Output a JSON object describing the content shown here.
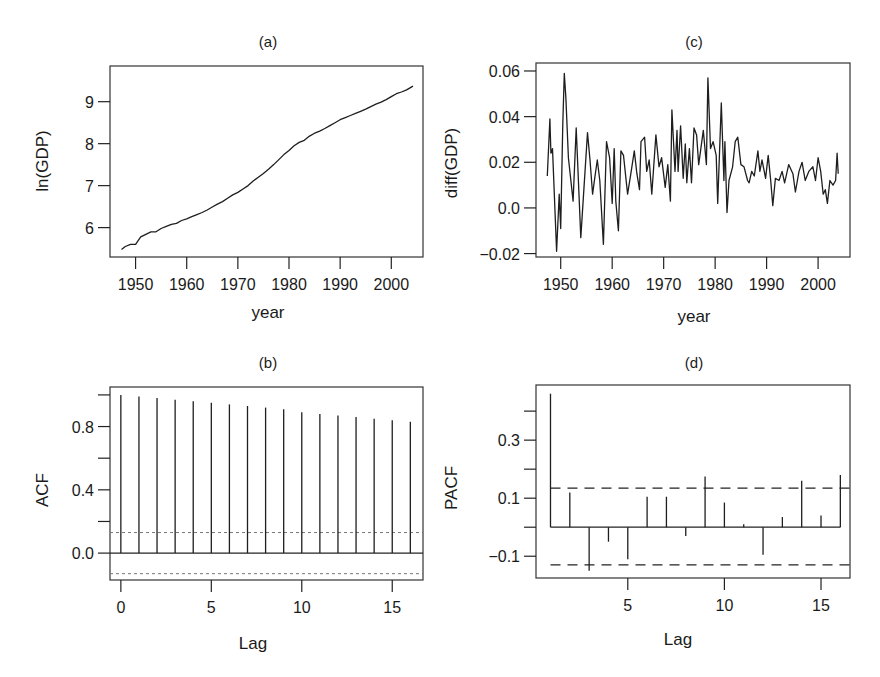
{
  "chart_data": [
    {
      "panel": "(a)",
      "type": "line",
      "title": "(a)",
      "xlabel": "year",
      "ylabel": "ln(GDP)",
      "xticks": [
        1950,
        1960,
        1970,
        1980,
        1990,
        2000
      ],
      "yticks": [
        6,
        7,
        8,
        9
      ],
      "xlim": [
        1945.0,
        2006.2
      ],
      "ylim": [
        5.3,
        9.85
      ],
      "grid": false,
      "x": [
        1947.25,
        1948,
        1949,
        1950,
        1951,
        1952,
        1953,
        1954,
        1955,
        1956,
        1957,
        1958,
        1959,
        1960,
        1961,
        1962,
        1963,
        1964,
        1965,
        1966,
        1967,
        1968,
        1969,
        1970,
        1971,
        1972,
        1973,
        1974,
        1975,
        1976,
        1977,
        1978,
        1979,
        1980,
        1981,
        1982,
        1983,
        1984,
        1985,
        1986,
        1987,
        1988,
        1989,
        1990,
        1991,
        1992,
        1993,
        1994,
        1995,
        1996,
        1997,
        1998,
        1999,
        2000,
        2001,
        2002,
        2003,
        2004.25
      ],
      "values": [
        5.48,
        5.55,
        5.6,
        5.6,
        5.78,
        5.84,
        5.9,
        5.9,
        5.98,
        6.03,
        6.08,
        6.1,
        6.17,
        6.21,
        6.26,
        6.31,
        6.36,
        6.42,
        6.49,
        6.56,
        6.62,
        6.7,
        6.78,
        6.84,
        6.92,
        7.0,
        7.11,
        7.2,
        7.29,
        7.39,
        7.5,
        7.62,
        7.74,
        7.84,
        7.95,
        8.03,
        8.08,
        8.18,
        8.25,
        8.3,
        8.36,
        8.43,
        8.5,
        8.57,
        8.62,
        8.67,
        8.72,
        8.77,
        8.82,
        8.88,
        8.94,
        8.99,
        9.05,
        9.12,
        9.19,
        9.23,
        9.28,
        9.37
      ]
    },
    {
      "panel": "(b)",
      "type": "bar",
      "subtype": "acf-stem",
      "title": "(b)",
      "xlabel": "Lag",
      "ylabel": "ACF",
      "xticks": [
        0,
        5,
        10,
        15
      ],
      "yticks_labeled": [
        0.0,
        0.4,
        0.8
      ],
      "yticks": [
        0.0,
        0.2,
        0.4,
        0.6,
        0.8,
        1.0
      ],
      "xlim": [
        -0.6,
        16.7
      ],
      "ylim": [
        -0.17,
        1.05
      ],
      "categories": [
        0,
        1,
        2,
        3,
        4,
        5,
        6,
        7,
        8,
        9,
        10,
        11,
        12,
        13,
        14,
        15,
        16
      ],
      "values": [
        1.0,
        0.99,
        0.98,
        0.97,
        0.96,
        0.95,
        0.94,
        0.93,
        0.92,
        0.91,
        0.89,
        0.88,
        0.87,
        0.86,
        0.85,
        0.84,
        0.83
      ],
      "confidence_band": [
        -0.13,
        0.13
      ],
      "band_style": "dotted",
      "grid": false
    },
    {
      "panel": "(c)",
      "type": "line",
      "title": "(c)",
      "xlabel": "year",
      "ylabel": "diff(GDP)",
      "xticks": [
        1950,
        1960,
        1970,
        1980,
        1990,
        2000
      ],
      "yticks": [
        -0.02,
        0.0,
        0.02,
        0.04,
        0.06
      ],
      "ytick_labels": [
        "−0.02",
        "0.0",
        "0.02",
        "0.04",
        "0.06"
      ],
      "xlim": [
        1945.2,
        2006.2
      ],
      "ylim": [
        -0.0215,
        0.0635
      ],
      "grid": false,
      "x": [
        1947.4,
        1947.9,
        1948.1,
        1948.4,
        1949.2,
        1949.7,
        1950.0,
        1950.4,
        1950.7,
        1951.0,
        1951.5,
        1952.4,
        1953.0,
        1953.9,
        1955.2,
        1955.7,
        1956.2,
        1956.6,
        1957.1,
        1957.6,
        1958.3,
        1958.9,
        1959.5,
        1960.0,
        1960.4,
        1960.7,
        1961.2,
        1961.7,
        1962.2,
        1963.0,
        1963.7,
        1964.3,
        1964.8,
        1965.3,
        1965.6,
        1966.3,
        1966.7,
        1967.2,
        1967.7,
        1968.5,
        1969.1,
        1969.6,
        1970.3,
        1970.8,
        1971.3,
        1971.6,
        1972.2,
        1972.6,
        1972.8,
        1973.3,
        1973.8,
        1974.2,
        1974.5,
        1975.0,
        1975.4,
        1975.9,
        1976.4,
        1976.8,
        1977.7,
        1978.3,
        1978.6,
        1979.1,
        1979.6,
        1980.2,
        1980.5,
        1981.2,
        1981.7,
        1981.9,
        1982.3,
        1982.7,
        1983.4,
        1983.9,
        1984.4,
        1985.0,
        1985.6,
        1986.3,
        1986.6,
        1987.1,
        1987.6,
        1988.3,
        1988.7,
        1989.1,
        1989.8,
        1990.3,
        1990.8,
        1991.2,
        1991.7,
        1992.4,
        1993.0,
        1993.5,
        1994.3,
        1995.1,
        1995.6,
        1996.3,
        1996.9,
        1997.5,
        1998.2,
        1999.0,
        1999.5,
        2000.0,
        2000.5,
        2001.0,
        2001.4,
        2001.8,
        2002.3,
        2002.9,
        2003.4,
        2003.7,
        2003.9
      ],
      "values": [
        0.014,
        0.039,
        0.024,
        0.026,
        -0.019,
        0.006,
        -0.009,
        0.037,
        0.059,
        0.048,
        0.022,
        0.003,
        0.035,
        -0.013,
        0.033,
        0.021,
        0.006,
        0.013,
        0.021,
        0.012,
        -0.016,
        0.029,
        0.022,
        0.002,
        0.026,
        0.003,
        -0.01,
        0.025,
        0.023,
        0.006,
        0.016,
        0.025,
        0.015,
        0.008,
        0.029,
        0.031,
        0.016,
        0.021,
        0.006,
        0.032,
        0.018,
        0.022,
        0.009,
        0.019,
        0.003,
        0.043,
        0.016,
        0.034,
        0.016,
        0.036,
        0.013,
        0.028,
        0.011,
        0.026,
        0.011,
        0.035,
        0.032,
        0.019,
        0.034,
        0.019,
        0.057,
        0.026,
        0.029,
        0.023,
        0.002,
        0.046,
        0.012,
        0.029,
        -0.002,
        0.012,
        0.018,
        0.029,
        0.031,
        0.019,
        0.018,
        0.012,
        0.011,
        0.016,
        0.014,
        0.025,
        0.016,
        0.021,
        0.013,
        0.023,
        0.012,
        0.001,
        0.013,
        0.012,
        0.016,
        0.011,
        0.019,
        0.015,
        0.007,
        0.016,
        0.02,
        0.012,
        0.016,
        0.018,
        0.012,
        0.022,
        0.016,
        0.006,
        0.008,
        0.002,
        0.012,
        0.01,
        0.012,
        0.024,
        0.015
      ]
    },
    {
      "panel": "(d)",
      "type": "bar",
      "subtype": "pacf-stem",
      "title": "(d)",
      "xlabel": "Lag",
      "ylabel": "PACF",
      "xticks": [
        5,
        10,
        15
      ],
      "yticks_labeled": [
        -0.1,
        0.1,
        0.3
      ],
      "ytick_labels": [
        "−0.1",
        "0.1",
        "0.3"
      ],
      "yticks": [
        -0.1,
        0.0,
        0.1,
        0.2,
        0.3,
        0.4
      ],
      "xlim": [
        0.25,
        16.5
      ],
      "ylim": [
        -0.175,
        0.49
      ],
      "categories": [
        1,
        2,
        3,
        4,
        5,
        6,
        7,
        8,
        9,
        10,
        11,
        12,
        13,
        14,
        15,
        16
      ],
      "values": [
        0.46,
        0.12,
        -0.15,
        -0.05,
        -0.11,
        0.105,
        0.105,
        -0.03,
        0.175,
        0.085,
        0.01,
        -0.095,
        0.035,
        0.16,
        0.04,
        0.18
      ],
      "confidence_band": [
        -0.13,
        0.135
      ],
      "band_style": "dashed",
      "grid": false
    }
  ]
}
